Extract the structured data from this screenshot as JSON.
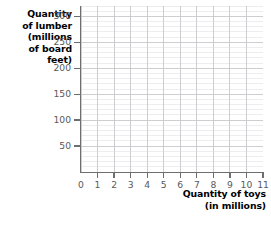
{
  "chart_data": {
    "type": "scatter",
    "title": "",
    "subtitle": "",
    "xlabel_lines": [
      "Quantity of toys",
      "(in millions)"
    ],
    "ylabel_lines": [
      "Quantity",
      "of lumber",
      "(millions",
      "of board",
      "feet)"
    ],
    "xlabel": "Quantity of toys (in millions)",
    "ylabel": "Quantity of lumber (millions of board feet)",
    "x_ticks": [
      0,
      1,
      2,
      3,
      4,
      5,
      6,
      7,
      8,
      9,
      10,
      11
    ],
    "x_tick_labels": [
      "0",
      "1",
      "2",
      "3",
      "4",
      "5",
      "6",
      "7",
      "8",
      "9",
      "10",
      "11"
    ],
    "y_ticks": [
      0,
      50,
      100,
      150,
      200,
      250,
      300
    ],
    "y_tick_labels": [
      "0",
      "50",
      "100",
      "150",
      "200",
      "250",
      "300"
    ],
    "xlim": [
      0,
      11
    ],
    "ylim": [
      0,
      320
    ],
    "x_minor_step": 1,
    "y_minor_step": 10,
    "grid": true,
    "grid_major_color": "#c9c9cc",
    "grid_minor_color": "#e6e6e8",
    "axis_color": "#6e6e6e",
    "tick_label_color": "#58585a",
    "axis_title_color": "#000000",
    "background": "#ffffff",
    "legend": null,
    "series": [],
    "data_points": [],
    "annotations": []
  }
}
